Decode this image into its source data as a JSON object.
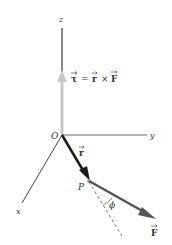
{
  "diagram": {
    "axes": {
      "z_label": "z",
      "y_label": "y",
      "x_label": "x"
    },
    "origin_label": "O",
    "point_label": "P",
    "vectors": {
      "r_label": "r",
      "F_label": "F",
      "tau_equation": {
        "lhs": "τ",
        "equals": "=",
        "r": "r",
        "times": "×",
        "F": "F"
      }
    },
    "angle_label": "ϕ",
    "colors": {
      "axis": "#444444",
      "z_axis_upper": "#888888",
      "torque_vector": "#c8c8c8",
      "r_vector": "#1a1a1a",
      "F_vector": "#555555",
      "dashed_line": "#555555"
    }
  }
}
